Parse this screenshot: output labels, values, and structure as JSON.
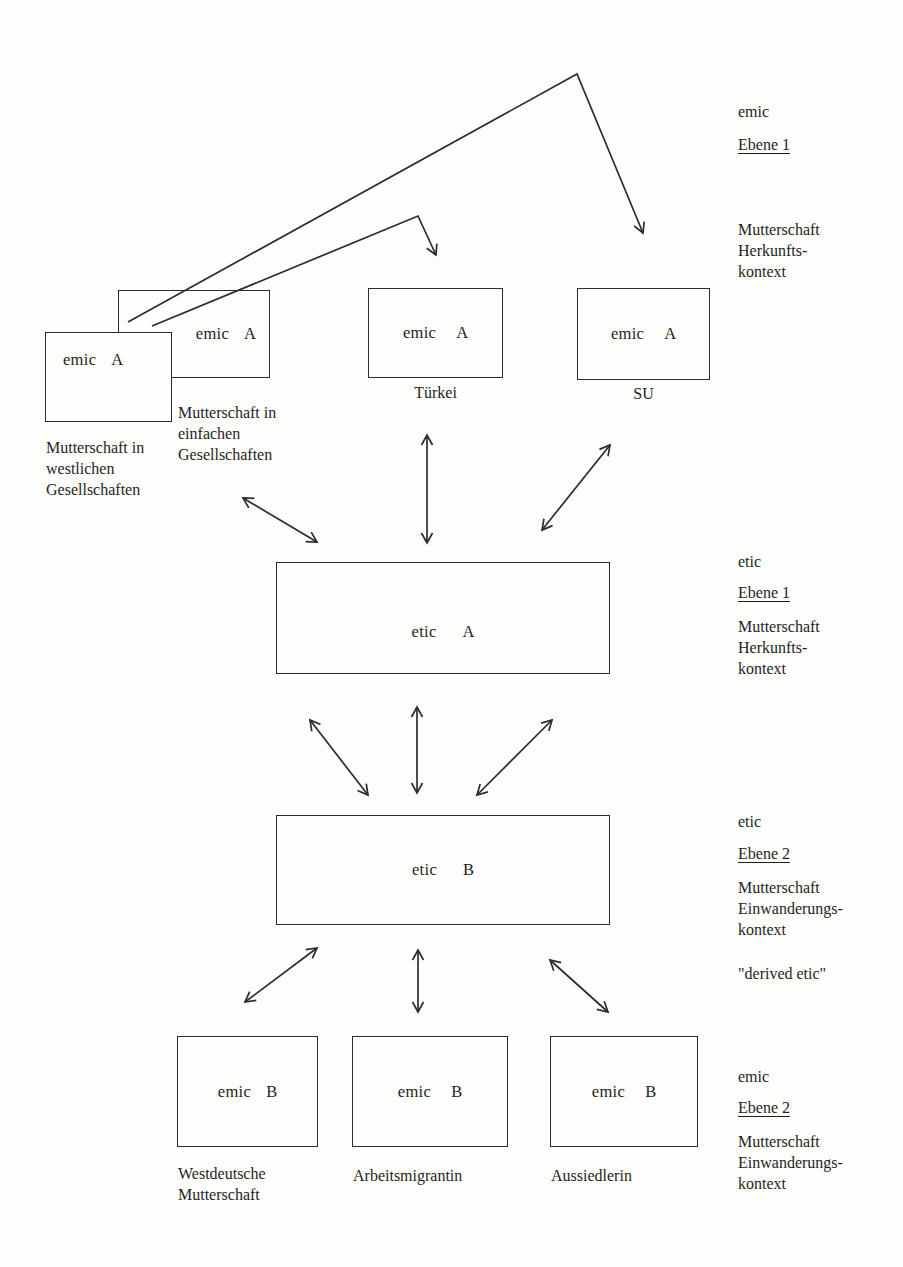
{
  "figure": {
    "boxes": {
      "western": {
        "term": "emic",
        "letter": "A",
        "caption_lines": [
          "Mutterschaft in",
          "westlichen",
          "Gesellschaften"
        ]
      },
      "einfach": {
        "term": "emic",
        "letter": "A",
        "caption_lines": [
          "Mutterschaft in",
          "einfachen",
          "Gesellschaften"
        ]
      },
      "tuerkei": {
        "term": "emic",
        "letter": "A",
        "caption": "Türkei"
      },
      "su": {
        "term": "emic",
        "letter": "A",
        "caption": "SU"
      },
      "etic_a": {
        "term": "etic",
        "letter": "A"
      },
      "etic_b": {
        "term": "etic",
        "letter": "B"
      },
      "westdeutsche": {
        "term": "emic",
        "letter": "B",
        "caption_lines": [
          "Westdeutsche",
          "Mutterschaft"
        ]
      },
      "arbeitsmigrantin": {
        "term": "emic",
        "letter": "B",
        "caption": "Arbeitsmigrantin"
      },
      "aussiedlerin": {
        "term": "emic",
        "letter": "B",
        "caption": "Aussiedlerin"
      }
    },
    "side_labels": [
      {
        "kind": "emic",
        "level": "Ebene 1",
        "lines": [
          "Mutterschaft",
          "Herkunfts-",
          "kontext"
        ],
        "extra": ""
      },
      {
        "kind": "etic",
        "level": "Ebene 1",
        "lines": [
          "Mutterschaft",
          "Herkunfts-",
          "kontext"
        ],
        "extra": ""
      },
      {
        "kind": "etic",
        "level": "Ebene 2",
        "lines": [
          "Mutterschaft",
          "Einwanderungs-",
          "kontext"
        ],
        "extra": "\"derived etic\""
      },
      {
        "kind": "emic",
        "level": "Ebene 2",
        "lines": [
          "Mutterschaft",
          "Einwanderungs-",
          "kontext"
        ],
        "extra": ""
      }
    ],
    "ink_color": "#2c2c2c"
  }
}
